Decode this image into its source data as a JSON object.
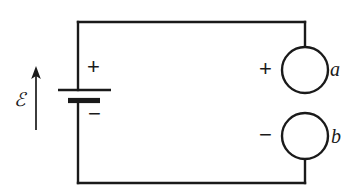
{
  "figure": {
    "name": "emf-circuit-with-open-terminals",
    "background_color": "#ffffff",
    "stroke_color": "#1a1a1a",
    "width": 353,
    "height": 196
  },
  "source": {
    "emf_label": "ℰ",
    "emf_arrow": {
      "direction": "up",
      "name": "emf-direction-arrow"
    },
    "battery": {
      "name": "battery-symbol",
      "positive_sign": "+",
      "negative_sign": "−"
    }
  },
  "terminals": [
    {
      "id": "a",
      "label": "a",
      "sign": "+",
      "position": "upper-right",
      "icon": "open-terminal-circle"
    },
    {
      "id": "b",
      "label": "b",
      "sign": "−",
      "position": "lower-right",
      "icon": "open-terminal-circle"
    }
  ],
  "wires": {
    "name": "circuit-wire-path",
    "segments": [
      "top-rail",
      "left-rail-upper",
      "left-rail-lower",
      "bottom-rail",
      "right-stub-upper",
      "right-stub-lower"
    ]
  }
}
